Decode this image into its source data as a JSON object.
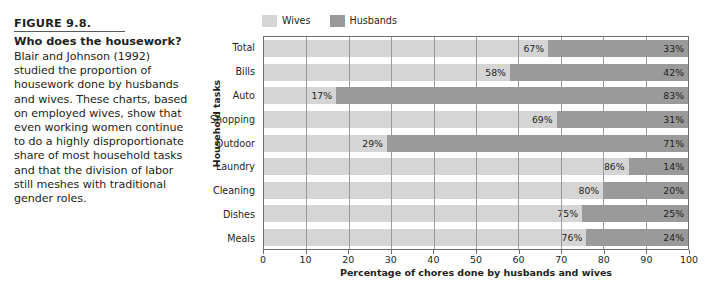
{
  "caption": {
    "figure_number": "FIGURE 9.8.",
    "title": "Who does the housework?",
    "body": "Blair and Johnson (1992) studied the proportion of housework done by husbands and wives. These charts, based on employed wives, show that even working women continue to do a highly disproportionate share of most household tasks and that the division of labor still meshes with traditional gender roles."
  },
  "colors": {
    "wives": "#d5d5d5",
    "husbands": "#9a9a9a",
    "frame": "#6d6e71",
    "text": "#231f20"
  },
  "chart_data": {
    "type": "bar",
    "orientation": "horizontal",
    "stacked": true,
    "stacked_mode": "percent",
    "title": "",
    "xlabel": "Percentage of chores done by husbands and wives",
    "ylabel": "Household tasks",
    "xlim": [
      0,
      100
    ],
    "xticks": [
      0,
      10,
      20,
      30,
      40,
      50,
      60,
      70,
      80,
      90,
      100
    ],
    "xticklabels": [
      "0",
      "10",
      "20",
      "30",
      "40",
      "50",
      "60",
      "70",
      "80",
      "90",
      "100"
    ],
    "grid": true,
    "legend_position": "top-left",
    "categories": [
      "Total",
      "Bills",
      "Auto",
      "Shopping",
      "Outdoor",
      "Laundry",
      "Cleaning",
      "Dishes",
      "Meals"
    ],
    "series": [
      {
        "name": "Wives",
        "color": "#d5d5d5",
        "values": [
          67,
          58,
          17,
          69,
          29,
          86,
          80,
          75,
          76
        ],
        "labels": [
          "67%",
          "58%",
          "17%",
          "69%",
          "29%",
          "86%",
          "80%",
          "75%",
          "76%"
        ]
      },
      {
        "name": "Husbands",
        "color": "#9a9a9a",
        "values": [
          33,
          42,
          83,
          31,
          71,
          14,
          20,
          25,
          24
        ],
        "labels": [
          "33%",
          "42%",
          "83%",
          "31%",
          "71%",
          "14%",
          "20%",
          "25%",
          "24%"
        ]
      }
    ]
  }
}
